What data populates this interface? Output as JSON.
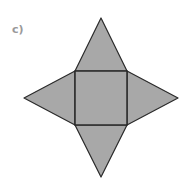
{
  "label": "c)",
  "diagram": {
    "type": "square-pyramid-net",
    "fill_color": "#a8a8a8",
    "stroke_color": "#2a2a2a",
    "square": {
      "x1": 75,
      "y1": 71,
      "x2": 127,
      "y2": 125
    },
    "apexes": {
      "top": [
        101,
        18
      ],
      "right": [
        178,
        98
      ],
      "bottom": [
        101,
        177
      ],
      "left": [
        24,
        98
      ]
    }
  }
}
